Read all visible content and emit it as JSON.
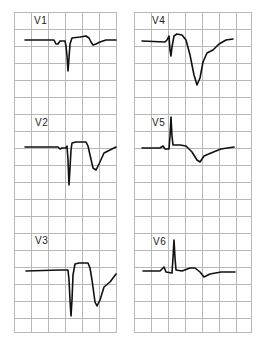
{
  "figure": {
    "left_column": {
      "leads": [
        {
          "label": "V1"
        },
        {
          "label": "V2"
        },
        {
          "label": "V3"
        }
      ]
    },
    "right_column": {
      "leads": [
        {
          "label": "V4"
        },
        {
          "label": "V5"
        },
        {
          "label": "V6"
        }
      ]
    },
    "colors": {
      "grid": "#b8b8b8",
      "trace": "#111111",
      "background": "#ffffff"
    }
  }
}
